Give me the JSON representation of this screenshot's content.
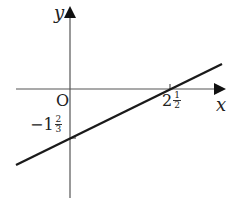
{
  "diagram": {
    "type": "coordinate-graph",
    "axes": {
      "x_label": "x",
      "y_label": "y",
      "origin_label": "O"
    },
    "line": {
      "x_intercept": {
        "whole": "2",
        "num": "1",
        "den": "2",
        "value": 2.5
      },
      "y_intercept": {
        "sign": "−",
        "whole": "1",
        "num": "2",
        "den": "3",
        "value": -1.6667
      }
    },
    "colors": {
      "axis": "#555555",
      "line": "#1a1a1a",
      "text": "#222222"
    }
  }
}
